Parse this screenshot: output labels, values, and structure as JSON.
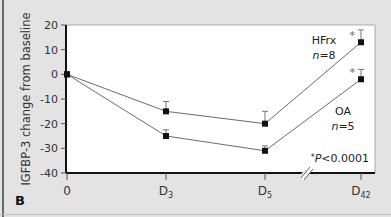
{
  "chart_data": {
    "type": "line",
    "title": "",
    "panel_label": "B",
    "xlabel": "",
    "ylabel": "IGFBP-3 change from baseline",
    "categories": [
      "0",
      "D3",
      "D5",
      "D42"
    ],
    "x_tick_labels": [
      {
        "main": "0",
        "sub": ""
      },
      {
        "main": "D",
        "sub": "3"
      },
      {
        "main": "D",
        "sub": "5"
      },
      {
        "main": "D",
        "sub": "42"
      }
    ],
    "ylim": [
      -40,
      20
    ],
    "yticks": [
      20,
      10,
      0,
      -10,
      -20,
      -30,
      -40
    ],
    "grid": false,
    "axis_break": "between D5 and D42",
    "series": [
      {
        "name": "HFrx",
        "n_label": "n=8",
        "values": [
          0,
          -15,
          -20,
          13
        ],
        "error_upper": [
          0,
          4,
          5,
          5
        ],
        "significant_markers": [
          false,
          false,
          false,
          true
        ]
      },
      {
        "name": "OA",
        "n_label": "n=5",
        "values": [
          0,
          -25,
          -31,
          -2
        ],
        "error_upper": [
          0,
          2.5,
          2,
          4
        ],
        "significant_markers": [
          false,
          false,
          false,
          true
        ]
      }
    ],
    "annotations": [
      "*P<0.0001"
    ],
    "colors": {
      "background": "#e3e3e3",
      "plot_area": "#ffffff",
      "line": "#6b6b6b",
      "marker": "#111111",
      "axis": "#111111"
    }
  },
  "labels": {
    "hfrx_name": "HFrx",
    "hfrx_n_italic": "n",
    "hfrx_n_rest": "=8",
    "oa_name": "OA",
    "oa_n_italic": "n",
    "oa_n_rest": "=5",
    "sig_star": "*",
    "sig_p_italic": "P",
    "sig_rest": "<0.0001",
    "star": "*"
  }
}
